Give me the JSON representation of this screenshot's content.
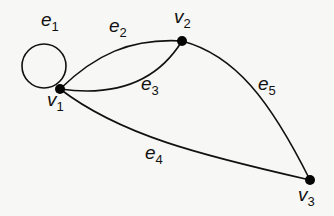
{
  "diagram": {
    "type": "graph",
    "vertices": [
      {
        "id": "v1",
        "base": "v",
        "sub": "1",
        "x": 60,
        "y": 89
      },
      {
        "id": "v2",
        "base": "v",
        "sub": "2",
        "x": 182,
        "y": 41
      },
      {
        "id": "v3",
        "base": "v",
        "sub": "3",
        "x": 310,
        "y": 180
      }
    ],
    "edges": [
      {
        "id": "e1",
        "base": "e",
        "sub": "1",
        "from": "v1",
        "to": "v1",
        "kind": "loop"
      },
      {
        "id": "e2",
        "base": "e",
        "sub": "2",
        "from": "v1",
        "to": "v2"
      },
      {
        "id": "e3",
        "base": "e",
        "sub": "3",
        "from": "v1",
        "to": "v2"
      },
      {
        "id": "e4",
        "base": "e",
        "sub": "4",
        "from": "v1",
        "to": "v3"
      },
      {
        "id": "e5",
        "base": "e",
        "sub": "5",
        "from": "v2",
        "to": "v3"
      }
    ],
    "colors": {
      "line": "#111111",
      "vertex": "#050505",
      "background": "#f7f7f5"
    }
  }
}
